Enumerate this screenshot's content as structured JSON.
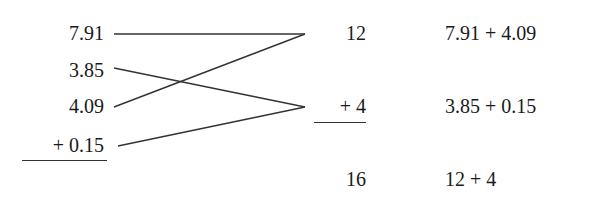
{
  "left_column": {
    "addends": [
      "7.91",
      "3.85",
      "4.09",
      "+ 0.15"
    ]
  },
  "middle_column": {
    "partial_sums": [
      "12",
      "+ 4"
    ],
    "total": "16"
  },
  "right_column": {
    "expressions": [
      "7.91 + 4.09",
      "3.85 + 0.15",
      "12 + 4"
    ]
  },
  "connections": [
    {
      "from": "7.91",
      "to": "12"
    },
    {
      "from": "4.09",
      "to": "12"
    },
    {
      "from": "3.85",
      "to": "+ 4"
    },
    {
      "from": "+ 0.15",
      "to": "+ 4"
    }
  ],
  "colors": {
    "text": "#1a1a1a",
    "line": "#333333",
    "background": "#ffffff"
  }
}
